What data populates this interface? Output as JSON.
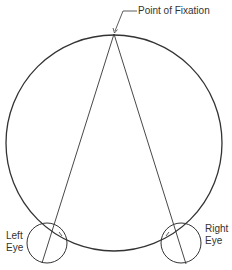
{
  "labels": {
    "fixation": "Point of Fixation",
    "left_eye_line1": "Left",
    "left_eye_line2": "Eye",
    "right_eye_line1": "Right",
    "right_eye_line2": "Eye"
  },
  "colors": {
    "stroke": "#333333",
    "background": "#ffffff"
  }
}
